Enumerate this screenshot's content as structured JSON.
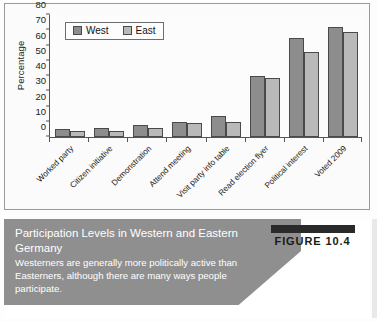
{
  "chart_data": {
    "type": "bar",
    "title": "",
    "xlabel": "",
    "ylabel": "Percentage",
    "ylim": [
      0,
      80
    ],
    "yticks": [
      0,
      10,
      20,
      30,
      40,
      50,
      60,
      70,
      80
    ],
    "grid": false,
    "legend_position": "top-left",
    "categories": [
      "Worked party",
      "Citizen initiative",
      "Demonstration",
      "Attend meeting",
      "Visit party info table",
      "Read election flyer",
      "Political interest",
      "Voted 2009"
    ],
    "series": [
      {
        "name": "West",
        "color": "#8d8d8d",
        "values": [
          5,
          6,
          8,
          10,
          14,
          40,
          65,
          72
        ]
      },
      {
        "name": "East",
        "color": "#b9b9b9",
        "values": [
          4,
          4,
          6,
          9,
          10,
          39,
          56,
          69
        ]
      }
    ]
  },
  "legend": {
    "items": [
      {
        "label": "West",
        "color": "#8d8d8d"
      },
      {
        "label": "East",
        "color": "#b9b9b9"
      }
    ]
  },
  "caption": {
    "title": "Participation Levels in Western and Eastern Germany",
    "body": "Westerners are generally more politically active than Easterners, although there are many ways people participate.",
    "figure_tag": "FIGURE 10.4"
  },
  "colors": {
    "west_bar": "#8d8d8d",
    "east_bar": "#b9b9b9",
    "caption_band": "#8f8f8f",
    "axis": "#555555"
  }
}
